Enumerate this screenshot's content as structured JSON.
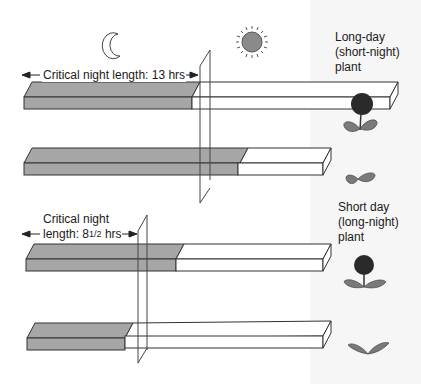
{
  "icons": {
    "moon": "crescent-moon",
    "sun": "sun"
  },
  "colors": {
    "night": "#a6a6a6",
    "day": "#ffffff",
    "outline": "#333333",
    "leaf": "#7a7a7a",
    "flower": "#2a2a2a"
  },
  "long_day": {
    "critical_label": "Critical night length: 13 hrs",
    "plant_label_line1": "Long-day",
    "plant_label_line2": "(short-night)",
    "plant_label_line3": "plant",
    "bars": [
      {
        "night_fraction": 0.55,
        "outcome": "flowers"
      },
      {
        "night_fraction": 0.72,
        "outcome": "no flowers"
      }
    ]
  },
  "short_day": {
    "critical_label_line1": "Critical night",
    "critical_label_line2_prefix": "length: 8",
    "critical_label_fraction": "1/2",
    "critical_label_line2_suffix": " hrs",
    "plant_label_line1": "Short day",
    "plant_label_line2": "(long-night)",
    "plant_label_line3": "plant",
    "bars": [
      {
        "night_fraction": 0.52,
        "outcome": "flowers"
      },
      {
        "night_fraction": 0.33,
        "outcome": "no flowers"
      }
    ]
  }
}
